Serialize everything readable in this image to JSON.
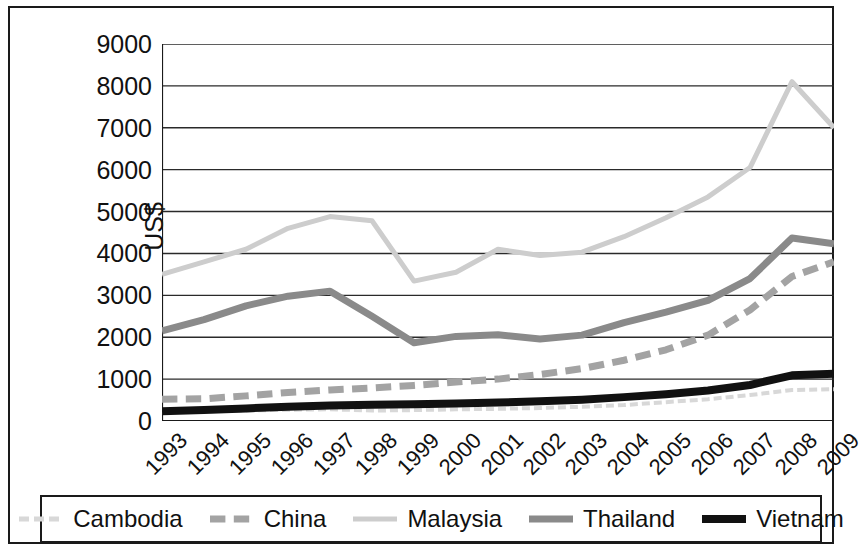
{
  "chart_data": {
    "type": "line",
    "title": "",
    "xlabel": "",
    "ylabel": "US$",
    "ylim": [
      0,
      9000
    ],
    "ytick_values": [
      9000,
      8000,
      7000,
      6000,
      5000,
      4000,
      3000,
      2000,
      1000,
      0
    ],
    "ytick_labels": [
      "9000",
      "8000",
      "7000",
      "6000",
      "5000",
      "4000",
      "3000",
      "2000",
      "1000",
      "0"
    ],
    "grid": "horizontal",
    "legend_position": "bottom",
    "categories": [
      "1993",
      "1994",
      "1995",
      "1996",
      "1997",
      "1998",
      "1999",
      "2000",
      "2001",
      "2002",
      "2003",
      "2004",
      "2005",
      "2006",
      "2007",
      "2008",
      "2009"
    ],
    "series": [
      {
        "name": "Cambodia",
        "color": "#d8d8d8",
        "style": "dotted",
        "width": 4,
        "values": [
          210,
          230,
          250,
          270,
          280,
          250,
          260,
          280,
          290,
          310,
          340,
          380,
          450,
          520,
          620,
          740,
          760
        ]
      },
      {
        "name": "China",
        "color": "#a3a3a3",
        "style": "dashed",
        "width": 7,
        "values": [
          520,
          530,
          600,
          680,
          740,
          790,
          850,
          930,
          1000,
          1110,
          1250,
          1450,
          1700,
          2050,
          2650,
          3450,
          3800
        ]
      },
      {
        "name": "Malaysia",
        "color": "#cdcdcd",
        "style": "solid",
        "width": 5,
        "values": [
          3500,
          3800,
          4100,
          4600,
          4880,
          4780,
          3340,
          3550,
          4100,
          3950,
          4030,
          4400,
          4850,
          5350,
          6050,
          8100,
          7000
        ]
      },
      {
        "name": "Thailand",
        "color": "#8a8a8a",
        "style": "solid",
        "width": 7,
        "values": [
          2150,
          2420,
          2750,
          2980,
          3100,
          2500,
          1870,
          2020,
          2060,
          1960,
          2050,
          2350,
          2600,
          2880,
          3400,
          4370,
          4230
        ]
      },
      {
        "name": "Vietnam",
        "color": "#111111",
        "style": "solid",
        "width": 8,
        "values": [
          230,
          260,
          300,
          340,
          370,
          390,
          400,
          420,
          440,
          470,
          510,
          570,
          640,
          730,
          860,
          1090,
          1130
        ]
      }
    ]
  },
  "legend": {
    "entries": [
      {
        "label": "Cambodia"
      },
      {
        "label": "China"
      },
      {
        "label": "Malaysia"
      },
      {
        "label": "Thailand"
      },
      {
        "label": "Vietnam"
      }
    ]
  }
}
